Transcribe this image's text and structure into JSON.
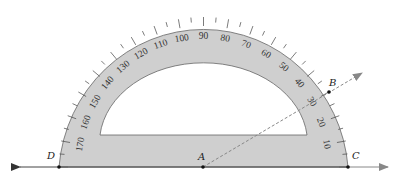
{
  "diagram": {
    "type": "protractor-angle-measurement",
    "colors": {
      "protractor_fill": "#cfcfcf",
      "protractor_edge": "#555555",
      "line": "#777777",
      "ray_dashed": "#888888",
      "point": "#111111",
      "background": "#ffffff"
    },
    "points": [
      {
        "id": "A",
        "label": "A",
        "role": "vertex"
      },
      {
        "id": "B",
        "label": "B",
        "role": "point on ray AB"
      },
      {
        "id": "C",
        "label": "C",
        "role": "point on right ray"
      },
      {
        "id": "D",
        "label": "D",
        "role": "point on left ray"
      }
    ],
    "scale_labels": [
      "10",
      "20",
      "30",
      "40",
      "50",
      "60",
      "70",
      "80",
      "90",
      "100",
      "110",
      "120",
      "130",
      "140",
      "150",
      "160",
      "170"
    ],
    "ray_AB_reading_degrees": 30
  }
}
